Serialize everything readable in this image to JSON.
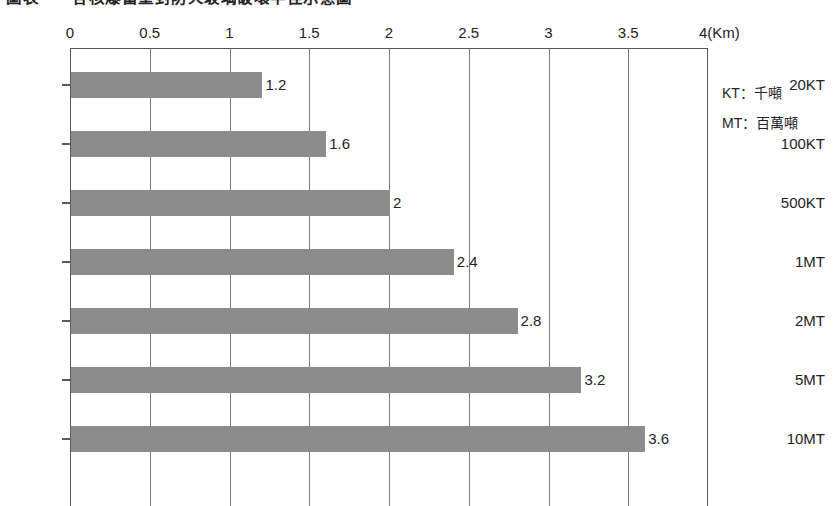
{
  "title": "圖表一　各核爆當量對防火玻璃破壞半徑示意圖",
  "legend": {
    "entries": [
      {
        "key": "KT",
        "label": "KT：千噸"
      },
      {
        "key": "MT",
        "label": "MT：百萬噸"
      }
    ]
  },
  "axis": {
    "unit_label": "4(Km)",
    "tick_labels": [
      "0",
      "0.5",
      "1",
      "1.5",
      "2",
      "2.5",
      "3",
      "3.5"
    ]
  },
  "colors": {
    "bar_fill": "#8c8c8c",
    "frame": "#5a5a5a",
    "gridline": "#7a7a7a",
    "text": "#232323"
  },
  "chart_data": {
    "type": "bar",
    "orientation": "horizontal",
    "title": "圖表一　各核爆當量對防火玻璃破壞半徑示意圖",
    "xlabel": "4(Km)",
    "ylabel": "",
    "xlim": [
      0,
      4
    ],
    "xticks": [
      0,
      0.5,
      1,
      1.5,
      2,
      2.5,
      3,
      3.5,
      4
    ],
    "grid": true,
    "legend_position": "right",
    "categories": [
      "20KT",
      "100KT",
      "500KT",
      "1MT",
      "2MT",
      "5MT",
      "10MT"
    ],
    "values": [
      1.2,
      1.6,
      2,
      2.4,
      2.8,
      3.2,
      3.6
    ],
    "value_labels": [
      "1.2",
      "1.6",
      "2",
      "2.4",
      "2.8",
      "3.2",
      "3.6"
    ],
    "legend": [
      "KT：千噸",
      "MT：百萬噸"
    ]
  }
}
